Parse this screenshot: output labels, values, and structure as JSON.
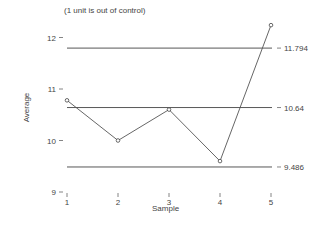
{
  "chart_data": {
    "type": "line",
    "title": "",
    "subtitle": "(1 unit is out of control)",
    "xlabel": "Sample",
    "ylabel": "Average",
    "x": [
      1,
      2,
      3,
      4,
      5
    ],
    "categories": [
      "1",
      "2",
      "3",
      "4",
      "5"
    ],
    "series": [
      {
        "name": "Average",
        "values": [
          10.78,
          10.0,
          10.6,
          9.6,
          12.24
        ]
      }
    ],
    "control_limits": {
      "ucl": 11.794,
      "center": 10.64,
      "lcl": 9.486,
      "ucl_label": "11.794",
      "center_label": "10.64",
      "lcl_label": "9.486"
    },
    "yticks": [
      9,
      10,
      11,
      12
    ],
    "ytick_labels": [
      "9",
      "10",
      "11",
      "12"
    ],
    "ylim": [
      9,
      12.3
    ],
    "grid": false,
    "legend": "none"
  }
}
